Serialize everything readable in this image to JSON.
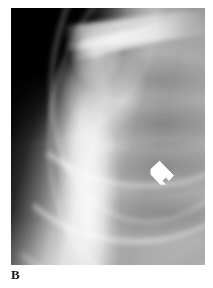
{
  "figure": {
    "panel_label": "B",
    "modality": "radiograph",
    "caption_region": "bottom-left",
    "page_background": "#ffffff",
    "image": {
      "name": "chest-shoulder-radiograph",
      "description": "Grayscale anteroposterior radiograph of the left shoulder and upper chest showing the humeral head, clavicle, scapula and rib cage over the lung field",
      "left_px": 11,
      "top_px": 8,
      "width_px": 194,
      "height_px": 257,
      "background_color": "#000000",
      "bright_color": "#ffffff",
      "midtone_color": "#8f8f8f",
      "regions": [
        {
          "name": "air-background",
          "label": "black air field",
          "position": "upper-left"
        },
        {
          "name": "humeral-head",
          "label": "humeral head",
          "position": "upper-center-left"
        },
        {
          "name": "clavicle",
          "label": "clavicle",
          "position": "top"
        },
        {
          "name": "acromion-scapular-spine",
          "label": "acromion / scapular spine",
          "position": "upper-center"
        },
        {
          "name": "humeral-shaft-soft-tissue",
          "label": "proximal humerus and arm soft tissue",
          "position": "lower-left-center"
        },
        {
          "name": "rib-cage",
          "label": "rib cage",
          "position": "right"
        },
        {
          "name": "lung-field",
          "label": "lung field",
          "position": "center-right"
        }
      ]
    },
    "annotations": [
      {
        "name": "arrow-marker",
        "type": "arrow",
        "color": "#ffffff",
        "points_to": "up-left",
        "target_region": "lung-field-lesion",
        "left_px": 148,
        "top_px": 158,
        "width_px": 30,
        "height_px": 29
      }
    ]
  }
}
